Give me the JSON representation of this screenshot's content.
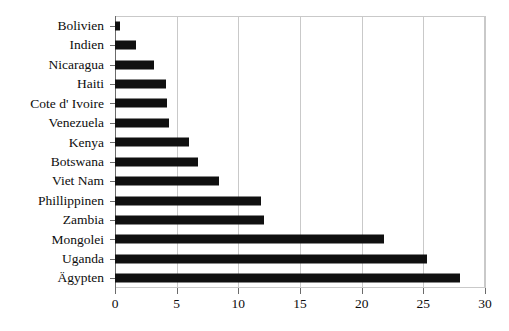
{
  "chart_data": {
    "type": "bar",
    "orientation": "horizontal",
    "title": "",
    "xlabel": "",
    "ylabel": "",
    "xlim": [
      0,
      30
    ],
    "grid": true,
    "legend": false,
    "bar_color": "#101010",
    "grid_color": "#c9c9c9",
    "axis_color": "#6b6b6b",
    "xticks": [
      0,
      5,
      10,
      15,
      20,
      25,
      30
    ],
    "xticklabels": [
      "0",
      "5",
      "10",
      "15",
      "20",
      "25",
      "30"
    ],
    "categories": [
      "Bolivien",
      "Indien",
      "Nicaragua",
      "Haiti",
      "Cote d' Ivoire",
      "Venezuela",
      "Kenya",
      "Botswana",
      "Viet Nam",
      "Phillippinen",
      "Zambia",
      "Mongolei",
      "Uganda",
      "Ägypten"
    ],
    "values": [
      0.4,
      1.7,
      3.2,
      4.1,
      4.2,
      4.4,
      6.0,
      6.7,
      8.4,
      11.8,
      12.1,
      21.8,
      25.3,
      28.0
    ]
  }
}
